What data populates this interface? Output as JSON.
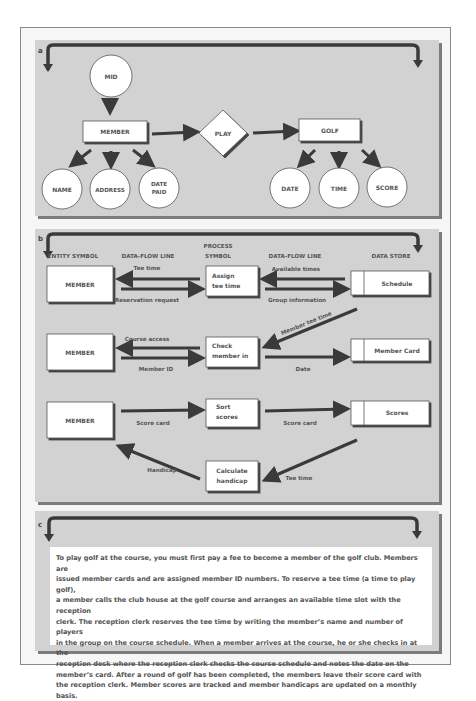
{
  "panel_a": {
    "letter": "a",
    "nodes": {
      "mid": "MID",
      "member": "MEMBER",
      "play": "PLAY",
      "golf": "GOLF",
      "name": "NAME",
      "address": "ADDRESS",
      "date_paid_1": "DATE",
      "date_paid_2": "PAID",
      "date": "DATE",
      "time": "TIME",
      "score": "SCORE"
    }
  },
  "panel_b": {
    "letter": "b",
    "headers": {
      "entity": "ENTITY SYMBOL",
      "flow1": "DATA-FLOW LINE",
      "process_1": "PROCESS",
      "process_2": "SYMBOL",
      "flow2": "DATA-FLOW LINE",
      "store": "DATA STORE"
    },
    "row1": {
      "entity": "MEMBER",
      "flow_left_top": "Tee time",
      "flow_left_bottom": "Reservation request",
      "process_1": "Assign",
      "process_2": "tee time",
      "flow_right_top": "Available times",
      "flow_right_bottom": "Group information",
      "store": "Schedule"
    },
    "diagonal_flow": "Member tee time",
    "row2": {
      "entity": "MEMBER",
      "flow_left_top": "Course access",
      "flow_left_bottom": "Member ID",
      "process_1": "Check",
      "process_2": "member in",
      "flow_right_bottom": "Date",
      "store": "Member Card"
    },
    "row3": {
      "entity": "MEMBER",
      "flow_left": "Score card",
      "process_1": "Sort",
      "process_2": "scores",
      "flow_right": "Score card",
      "store": "Scores"
    },
    "row4": {
      "flow_left": "Handicap",
      "process_1": "Calculate",
      "process_2": "handicap",
      "flow_right": "Tee time"
    }
  },
  "panel_c": {
    "letter": "c",
    "lines": [
      "To play golf at the course, you must first pay a fee to become a member of the golf club. Members are",
      "issued member cards and are assigned member ID numbers. To reserve a tee time (a time to play golf),",
      "a member calls the club house at the golf course and arranges an available time slot with the reception",
      "clerk. The reception clerk reserves the tee time by writing the member’s name and number of players",
      "in the group on the course schedule. When a member arrives at the course, he or she checks in at the",
      "reception desk where the reception clerk checks the course schedule and notes the date on the",
      "member’s card. After a round of golf has been completed, the members leave their score card with",
      "the reception clerk. Member scores are tracked and member handicaps are updated on a monthly basis."
    ]
  }
}
